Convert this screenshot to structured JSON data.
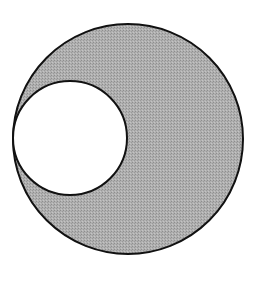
{
  "diagram": {
    "type": "nested-circles",
    "background": "#ffffff",
    "stroke_color": "#111111",
    "outer_circle": {
      "cx": 128,
      "cy": 139,
      "r": 115,
      "fill": "#a9a9a9"
    },
    "inner_circle": {
      "cx": 70,
      "cy": 138,
      "r": 57,
      "fill": "#ffffff"
    }
  }
}
